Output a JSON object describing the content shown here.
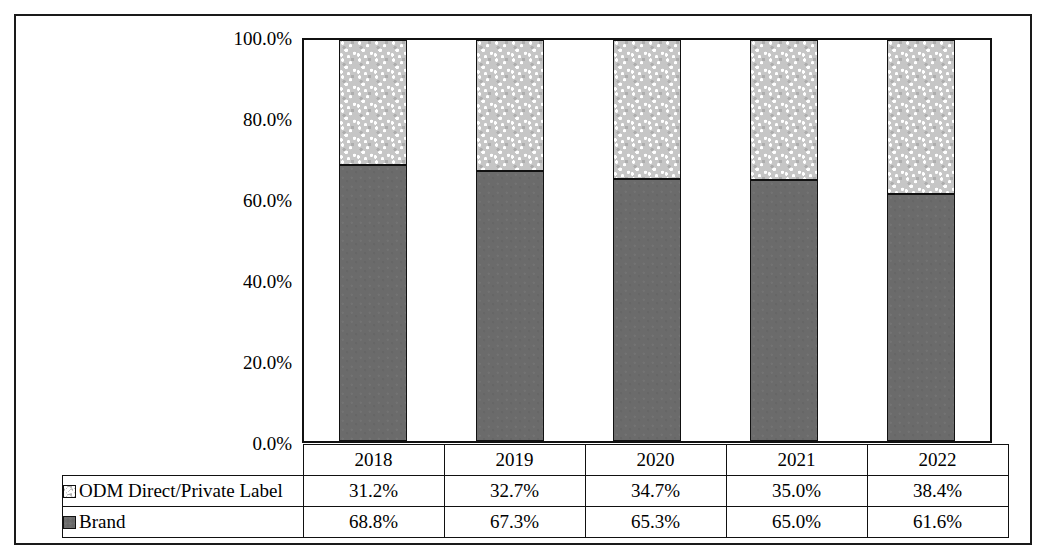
{
  "chart_data": {
    "type": "bar",
    "subtype": "stacked-100-percent",
    "title": "",
    "xlabel": "",
    "ylabel": "",
    "categories": [
      "2018",
      "2019",
      "2020",
      "2021",
      "2022"
    ],
    "series": [
      {
        "name": "ODM Direct/Private Label",
        "values": [
          31.2,
          32.7,
          34.7,
          35.0,
          38.4
        ],
        "labels": [
          "31.2%",
          "32.7%",
          "34.7%",
          "35.0%",
          "38.4%"
        ],
        "color": "#c6c6c6",
        "fill": "speckled-light-gray"
      },
      {
        "name": "Brand",
        "values": [
          68.8,
          67.3,
          65.3,
          65.0,
          61.6
        ],
        "labels": [
          "68.8%",
          "67.3%",
          "65.3%",
          "65.0%",
          "61.6%"
        ],
        "color": "#6b6b6b",
        "fill": "solid-dark-gray"
      }
    ],
    "ylim": [
      0,
      100
    ],
    "yticks": [
      0,
      20,
      40,
      60,
      80,
      100
    ],
    "ytick_labels": [
      "0.0%",
      "20.0%",
      "40.0%",
      "60.0%",
      "80.0%",
      "100.0%"
    ],
    "grid": false,
    "legend_position": "data-table-row-labels",
    "stack_order_top_to_bottom": [
      "ODM Direct/Private Label",
      "Brand"
    ]
  },
  "table": {
    "header_row": [
      "",
      "2018",
      "2019",
      "2020",
      "2021",
      "2022"
    ],
    "rows": [
      {
        "label": "ODM Direct/Private Label",
        "swatch": "odm-swatch",
        "values": [
          "31.2%",
          "32.7%",
          "34.7%",
          "35.0%",
          "38.4%"
        ]
      },
      {
        "label": "Brand",
        "swatch": "brand-swatch",
        "values": [
          "68.8%",
          "67.3%",
          "65.3%",
          "65.0%",
          "61.6%"
        ]
      }
    ]
  },
  "axis": {
    "y_tick_labels": [
      "100.0%",
      "80.0%",
      "60.0%",
      "40.0%",
      "20.0%",
      "0.0%"
    ]
  },
  "colors": {
    "odm_fill": "#c6c6c6",
    "brand_fill": "#6b6b6b",
    "line": "#111111",
    "background": "#ffffff"
  }
}
